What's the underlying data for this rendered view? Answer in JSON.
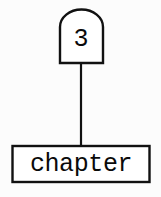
{
  "diagram": {
    "type": "node-link-diagram",
    "background_color": "#fcfcfc",
    "stroke_color": "#111111",
    "nodes": [
      {
        "id": "chapter-number",
        "shape": "arched-top-rectangle",
        "label": "3",
        "fill": "#ffffff",
        "stroke": "#111111"
      },
      {
        "id": "chapter-name",
        "shape": "rectangle",
        "label": "chapter",
        "fill": "#ffffff",
        "stroke": "#111111"
      }
    ],
    "edges": [
      {
        "id": "number-to-name",
        "from": "chapter-number",
        "to": "chapter-name",
        "style": "straight-vertical-line",
        "stroke": "#111111"
      }
    ]
  }
}
